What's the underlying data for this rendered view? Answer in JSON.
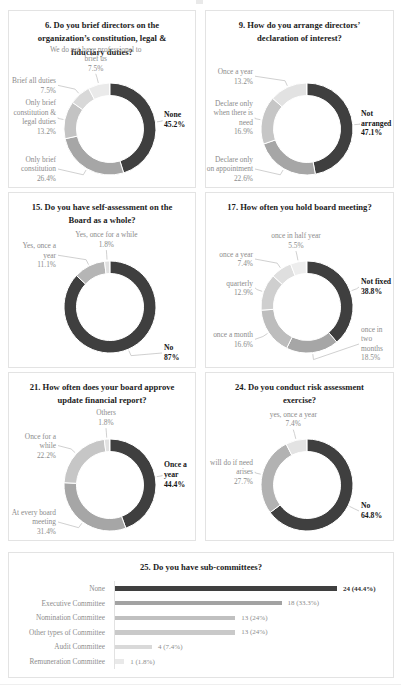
{
  "page": {
    "background": "#ffffff",
    "panel_border_color": "#e3e3e3",
    "label_color": "#8c8c8c",
    "emphasis_color": "#151515"
  },
  "chart_data": [
    {
      "type": "donut",
      "title": "6. Do you brief directors on the organization’s constitution, legal & fiduciary duties?",
      "segments": [
        {
          "label": "None",
          "pct": 45.2,
          "pct_text": "45.2%",
          "color": "#3f3f3f",
          "emphasis": true
        },
        {
          "label": "Only brief constitution",
          "pct": 26.4,
          "pct_text": "26.4%",
          "color": "#a6a6a6"
        },
        {
          "label": "Only brief constitution & legal duties",
          "pct": 13.2,
          "pct_text": "13.2%",
          "color": "#c3c3c3"
        },
        {
          "label": "Brief all duties",
          "pct": 7.5,
          "pct_text": "7.5%",
          "color": "#d8d8d8"
        },
        {
          "label": "We do not have professional to brief us",
          "pct": 7.5,
          "pct_text": "7.5%",
          "color": "#eaeaea"
        }
      ]
    },
    {
      "type": "donut",
      "title": "9. How do you arrange directors’ declaration of interest?",
      "segments": [
        {
          "label": "Not arranged",
          "pct": 47.1,
          "pct_text": "47.1%",
          "color": "#3f3f3f",
          "emphasis": true
        },
        {
          "label": "Declare only on appointment",
          "pct": 22.6,
          "pct_text": "22.6%",
          "color": "#a6a6a6"
        },
        {
          "label": "Declare only when there is need",
          "pct": 16.9,
          "pct_text": "16.9%",
          "color": "#c6c6c6"
        },
        {
          "label": "Once a year",
          "pct": 13.2,
          "pct_text": "13.2%",
          "color": "#e2e2e2"
        }
      ]
    },
    {
      "type": "donut",
      "title": "15. Do you have self-assessment on the Board as a whole?",
      "segments": [
        {
          "label": "No",
          "pct": 87.0,
          "pct_text": "87%",
          "color": "#3f3f3f",
          "emphasis": true
        },
        {
          "label": "Yes, once a year",
          "pct": 11.1,
          "pct_text": "11.1%",
          "color": "#b5b5b5"
        },
        {
          "label": "Yes, once for a while",
          "pct": 1.8,
          "pct_text": "1.8%",
          "color": "#e0e0e0"
        }
      ]
    },
    {
      "type": "donut",
      "title": "17. How often you hold board meeting?",
      "segments": [
        {
          "label": "Not fixed",
          "pct": 38.8,
          "pct_text": "38.8%",
          "color": "#3f3f3f",
          "emphasis": true
        },
        {
          "label": "once in two months",
          "pct": 18.5,
          "pct_text": "18.5%",
          "color": "#a6a6a6"
        },
        {
          "label": "once a month",
          "pct": 16.6,
          "pct_text": "16.6%",
          "color": "#bdbdbd"
        },
        {
          "label": "quarterly",
          "pct": 12.9,
          "pct_text": "12.9%",
          "color": "#cfcfcf"
        },
        {
          "label": "once a year",
          "pct": 7.4,
          "pct_text": "7.4%",
          "color": "#dfdfdf"
        },
        {
          "label": "once in half year",
          "pct": 5.5,
          "pct_text": "5.5%",
          "color": "#ededed"
        }
      ]
    },
    {
      "type": "donut",
      "title": "21. How often does your board approve update financial report?",
      "segments": [
        {
          "label": "Once a year",
          "pct": 44.4,
          "pct_text": "44.4%",
          "color": "#3f3f3f",
          "emphasis": true
        },
        {
          "label": "At every board meeting",
          "pct": 31.4,
          "pct_text": "31.4%",
          "color": "#a6a6a6"
        },
        {
          "label": "Once for a while",
          "pct": 22.2,
          "pct_text": "22.2%",
          "color": "#c6c6c6"
        },
        {
          "label": "Others",
          "pct": 1.8,
          "pct_text": "1.8%",
          "color": "#e2e2e2"
        }
      ]
    },
    {
      "type": "donut",
      "title": "24. Do you conduct risk assessment exercise?",
      "segments": [
        {
          "label": "No",
          "pct": 64.8,
          "pct_text": "64.8%",
          "color": "#3f3f3f",
          "emphasis": true
        },
        {
          "label": "will do if need arises",
          "pct": 27.7,
          "pct_text": "27.7%",
          "color": "#b2b2b2"
        },
        {
          "label": "yes, once a year",
          "pct": 7.4,
          "pct_text": "7.4%",
          "color": "#e3e3e3"
        }
      ]
    },
    {
      "type": "bar",
      "title": "25. Do you have sub-committees?",
      "categories": [
        "None",
        "Executive Committee",
        "Nomination Committee",
        "Other types of Committee",
        "Audit Committee",
        "Remuneration Committee"
      ],
      "values": [
        24,
        18,
        13,
        13,
        4,
        1
      ],
      "value_labels": [
        "24 (44.4%)",
        "18 (33.3%)",
        "13 (24%)",
        "13 (24%)",
        "4 (7.4%)",
        "1 (1.8%)"
      ],
      "colors": [
        "#3f3f3f",
        "#a2a2a2",
        "#c0c0c0",
        "#c9c9c9",
        "#d9d9d9",
        "#e9e9e9"
      ],
      "xmax": 24,
      "legend": "none",
      "grid": "off"
    }
  ]
}
